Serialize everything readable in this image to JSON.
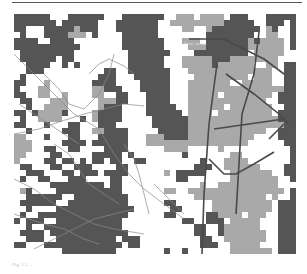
{
  "figure": {
    "caption": "Fig. 1.1 ...",
    "map_label": "Boro...ta km",
    "colors": {
      "background": "#ffffff",
      "class_0": "#ffffff",
      "class_1": "#a9a9a9",
      "class_2": "#555555",
      "road_thin": "#8a8a8a",
      "road_major": "#4a4a4a"
    },
    "cell_size": 6,
    "columns": 47,
    "rows": 40
  },
  "grid_rows": [
    "22222200022222200022222220011101111022200022222",
    "22222220222222000222222200111111111222220022202",
    "22000222221222000222222200001100122222222012002",
    "02000222211102000022222200000000222222220011002",
    "22220022220000000022222220001110222222212111102",
    "22222222222000000022222220000111222222211111102",
    "02222222220000000002222222000022222222201111100",
    "02222220220000000002222220001111122211111111000",
    "00222200202000000002222220001111121111110011022",
    "00222000000000022002222222000111111111111110022",
    "02000000000000222000222222000011111111101110022",
    "22000100000002222000022222000111111100111110022",
    "20001100000001122200022222000111111111111111122",
    "22001100100001100220002222000111110111111110222",
    "02200011100000111220002222000111111111111100222",
    "00200111100000122200002222200111111011111110022",
    "22021111200001222200002222220111101111111110222",
    "02001111000201222200000222222111111111111111222",
    "22000200022000222000000222222111111111111111122",
    "00200000222001122220000022222111111111111100222",
    "11000200022000222220001112222111111111110000222",
    "11100000222202222220001111111111111111100000022",
    "11100220022000022220000001111000001000000000002",
    "11000022000002222202000000002000000011000000002",
    "10000220220202202200220000000002000111100000002",
    "02200022002220000220000000000022200111111000022",
    "00222000220222022220000001022222000011111110022",
    "02002200022200002200000000022000000011111111002",
    "00000022222222202200000000000001001111111111000",
    "01200002222222222200000001100111111111111111102",
    "00222222002222222220000000000011111111111101002",
    "02222220022222222220000002200000011111111110222",
    "00200002222222222222000000220000011111111110222",
    "02002222222222222220000002200000221111011100222",
    "20222002222222222200000000002200222011111000222",
    "00200222222222222200000000000022002111111000222",
    "02222022222222222220000000000022002111111100222",
    "00222002222222222022200000000002200111111100222",
    "22000222222222222202200000000002220011111000222",
    "00000000222222222000000002002000000011111110222"
  ],
  "roads": {
    "thin": [
      "0,40 20,60 40,80 60,100 85,115 100,140 115,160 130,175 150,190 170,205",
      "0,120 25,115 45,108 70,100 90,95 110,90 130,92",
      "0,165 20,175 40,190 60,200 80,210 100,215 130,220",
      "30,60 45,75 55,90 70,95 85,80 95,60 100,40",
      "75,60 85,50 95,45 110,52 120,60",
      "0,200 15,205 30,210 50,215 70,225 85,230",
      "40,130 55,140 65,155 75,170 90,180 105,190",
      "110,130 120,145 125,160 130,180 135,200",
      "20,235 40,225 60,215 80,205 100,200 120,195",
      "5,90 20,100 35,110 50,120 65,130",
      "140,170 150,180 160,190 170,200"
    ],
    "major": [
      "175,25 210,25 250,45 270,60",
      "203,50 195,110 190,180 188,240",
      "212,60 240,80 265,100 275,110",
      "245,18 240,60 228,100 222,200",
      "200,115 270,105",
      "270,110 255,125",
      "195,145 210,160 222,160 240,150 260,138"
    ]
  }
}
